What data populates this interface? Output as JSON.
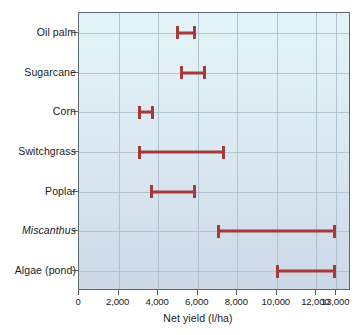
{
  "chart_data": {
    "type": "bar",
    "subtype": "range-bar",
    "title": "",
    "xlabel": "Net yield (l/ha)",
    "ylabel": "",
    "xlim": [
      0,
      13750
    ],
    "xticks": [
      0,
      2000,
      4000,
      6000,
      8000,
      10000,
      12000,
      13000
    ],
    "xticklabels": [
      "0",
      "2,000",
      "4,000",
      "6,000",
      "8,000",
      "10,000",
      "12,000",
      "13,000"
    ],
    "gridlines": [
      2000,
      4000,
      6000,
      8000,
      10000,
      12000,
      13000
    ],
    "grid": true,
    "legend": "none",
    "categories": [
      "Oil palm",
      "Sugarcane",
      "Corn",
      "Switchgrass",
      "Poplar",
      "Miscanthus",
      "Algae (pond)"
    ],
    "italic_categories": [
      "Miscanthus"
    ],
    "series": [
      {
        "name": "Net yield range",
        "color": "#a63a39",
        "ranges": [
          {
            "category": "Oil palm",
            "low": 4900,
            "high": 5900
          },
          {
            "category": "Sugarcane",
            "low": 5100,
            "high": 6400
          },
          {
            "category": "Corn",
            "low": 3000,
            "high": 3800
          },
          {
            "category": "Switchgrass",
            "low": 3000,
            "high": 7400
          },
          {
            "category": "Poplar",
            "low": 3600,
            "high": 5900
          },
          {
            "category": "Miscanthus",
            "low": 6950,
            "high": 13000
          },
          {
            "category": "Algae (pond)",
            "low": 9950,
            "high": 13000
          }
        ]
      }
    ],
    "colors": {
      "bar": "#a63a39",
      "grid": "#a9bcc8",
      "axis": "#5d6a72",
      "plot_background_top": "#e3f4f8",
      "plot_background_bottom": "#ccd8e6",
      "text": "#1a1a1a"
    }
  }
}
